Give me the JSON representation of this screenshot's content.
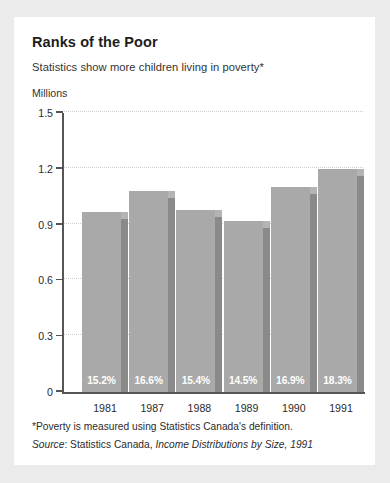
{
  "card": {
    "background": "#ffffff",
    "page_background": "#ebebeb"
  },
  "chart_data": {
    "type": "bar",
    "title": "Ranks of the Poor",
    "subtitle": "Statistics show more children living in poverty*",
    "ylabel": "Millions",
    "xlabel": "",
    "categories": [
      "1981",
      "1987",
      "1988",
      "1989",
      "1990",
      "1991"
    ],
    "values": [
      0.97,
      1.08,
      0.98,
      0.92,
      1.1,
      1.2
    ],
    "data_labels": [
      "15.2%",
      "16.6%",
      "15.4%",
      "14.5%",
      "16.9%",
      "18.3%"
    ],
    "ylim": [
      0,
      1.5
    ],
    "yticks": [
      "0",
      "0.3",
      "0.6",
      "0.9",
      "1.2",
      "1.5"
    ],
    "ytick_values": [
      0,
      0.3,
      0.6,
      0.9,
      1.2,
      1.5
    ],
    "grid": true,
    "legend": "none",
    "bar_color": "#a9a9a9",
    "bar_side_color": "#8a8a8a",
    "bar_top_color": "#b4b4b4",
    "axis_color": "#555555",
    "grid_color": "#cfcfcf",
    "label_color": "#ffffff"
  },
  "footnote": "*Poverty is measured using Statistics Canada's definition.",
  "source": {
    "prefix": "Source",
    "separator": ": ",
    "agency": "Statistics Canada, ",
    "publication": "Income Distributions by Size, 1991"
  }
}
